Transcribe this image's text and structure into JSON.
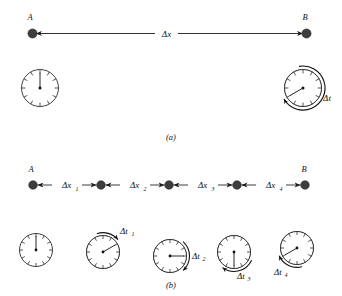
{
  "figure": {
    "background_color": "#ffffff",
    "ink_color": "#1a1a1a",
    "dot_color": "#3d3d3d",
    "wedge_color": "#b4b4b4"
  },
  "panel_a": {
    "caption": "(a)",
    "point_start_label": "A",
    "point_end_label": "B",
    "displacement_label": "Δx",
    "elapsed_label": "Δt",
    "clock_start": {
      "name": "clock-a-start",
      "hand_hour": 12,
      "shaded_from_hour": 12,
      "shaded_to_hour": 12,
      "has_arc_arrow": false
    },
    "clock_end": {
      "name": "clock-a-end",
      "hand_hour": 8,
      "shaded_from_hour": 12,
      "shaded_to_hour": 8,
      "has_arc_arrow": true
    }
  },
  "panel_b": {
    "caption": "(b)",
    "point_start_label": "A",
    "point_end_label": "B",
    "segments": [
      {
        "label": "Δx",
        "subscript": "1"
      },
      {
        "label": "Δx",
        "subscript": "2"
      },
      {
        "label": "Δx",
        "subscript": "3"
      },
      {
        "label": "Δx",
        "subscript": "4"
      }
    ],
    "intervals": [
      {
        "label": "Δt",
        "subscript": "1"
      },
      {
        "label": "Δt",
        "subscript": "2"
      },
      {
        "label": "Δt",
        "subscript": "3"
      },
      {
        "label": "Δt",
        "subscript": "4"
      }
    ],
    "clocks": [
      {
        "name": "clock-b-0",
        "hand_hour": 12,
        "shaded_from_hour": 12,
        "shaded_to_hour": 12,
        "has_arc_arrow": false
      },
      {
        "name": "clock-b-1",
        "hand_hour": 2,
        "shaded_from_hour": 12,
        "shaded_to_hour": 2,
        "has_arc_arrow": true
      },
      {
        "name": "clock-b-2",
        "hand_hour": 3,
        "shaded_from_hour": 1,
        "shaded_to_hour": 3,
        "has_arc_arrow": true
      },
      {
        "name": "clock-b-3",
        "hand_hour": 6,
        "shaded_from_hour": 3,
        "shaded_to_hour": 6,
        "has_arc_arrow": true
      },
      {
        "name": "clock-b-4",
        "hand_hour": 8,
        "shaded_from_hour": 6,
        "shaded_to_hour": 8,
        "has_arc_arrow": true
      }
    ]
  }
}
